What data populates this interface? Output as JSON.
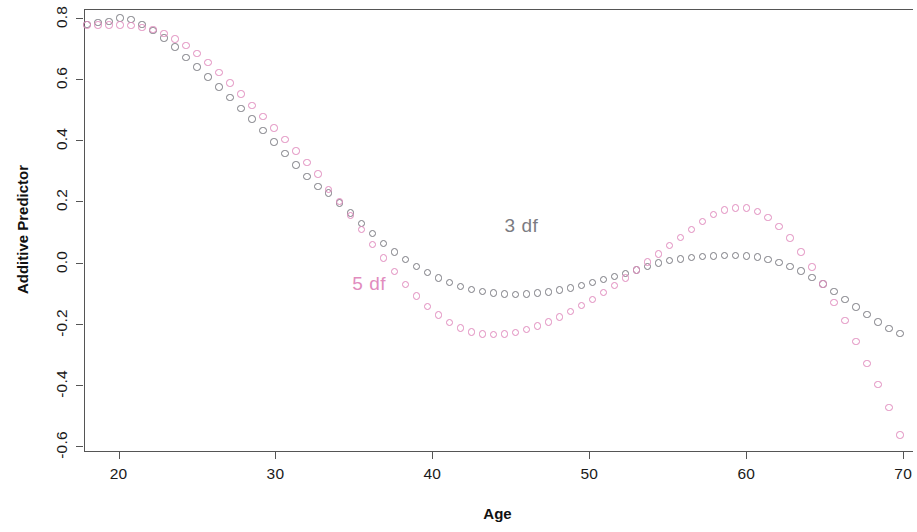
{
  "chart_data": {
    "type": "scatter",
    "title": "",
    "xlabel": "Age",
    "ylabel": "Additive Predictor",
    "xlim": [
      17.8,
      70.5
    ],
    "ylim": [
      -0.62,
      0.83
    ],
    "xticks": [
      20,
      30,
      40,
      50,
      60,
      70
    ],
    "yticks": [
      -0.6,
      -0.4,
      -0.2,
      0.0,
      0.2,
      0.4,
      0.6,
      0.8
    ],
    "xtick_labels": [
      "20",
      "30",
      "40",
      "50",
      "60",
      "70"
    ],
    "ytick_labels": [
      "-0.6",
      "-0.4",
      "-0.2",
      "0.0",
      "0.2",
      "0.4",
      "0.6",
      "0.8"
    ],
    "grid": false,
    "legend_position": "inline-annotations",
    "marker": "open-circle",
    "series": [
      {
        "name": "3 df",
        "color": "#7b7b82",
        "annotation": "3 df",
        "annotation_x": 44.6,
        "annotation_y": 0.115,
        "x": [
          18.0,
          18.7,
          19.4,
          20.1,
          20.8,
          21.5,
          22.2,
          22.9,
          23.6,
          24.3,
          25.0,
          25.7,
          26.4,
          27.1,
          27.8,
          28.5,
          29.2,
          29.9,
          30.6,
          31.3,
          32.0,
          32.7,
          33.4,
          34.1,
          34.8,
          35.5,
          36.2,
          36.9,
          37.6,
          38.3,
          39.0,
          39.7,
          40.4,
          41.1,
          41.8,
          42.5,
          43.2,
          43.9,
          44.6,
          45.3,
          46.0,
          46.7,
          47.4,
          48.1,
          48.8,
          49.5,
          50.2,
          50.9,
          51.6,
          52.3,
          53.0,
          53.7,
          54.4,
          55.1,
          55.8,
          56.5,
          57.2,
          57.9,
          58.6,
          59.3,
          60.0,
          60.7,
          61.4,
          62.1,
          62.8,
          63.5,
          64.2,
          64.9,
          65.6,
          66.3,
          67.0,
          67.7,
          68.4,
          69.1,
          69.8
        ],
        "y": [
          0.78,
          0.785,
          0.79,
          0.8,
          0.795,
          0.78,
          0.76,
          0.735,
          0.705,
          0.672,
          0.64,
          0.608,
          0.575,
          0.54,
          0.505,
          0.47,
          0.432,
          0.395,
          0.358,
          0.32,
          0.282,
          0.25,
          0.228,
          0.195,
          0.162,
          0.128,
          0.095,
          0.062,
          0.035,
          0.01,
          -0.012,
          -0.032,
          -0.05,
          -0.065,
          -0.078,
          -0.088,
          -0.095,
          -0.1,
          -0.103,
          -0.104,
          -0.103,
          -0.1,
          -0.096,
          -0.09,
          -0.083,
          -0.075,
          -0.066,
          -0.056,
          -0.046,
          -0.035,
          -0.024,
          -0.013,
          -0.002,
          0.006,
          0.012,
          0.017,
          0.02,
          0.022,
          0.023,
          0.023,
          0.022,
          0.018,
          0.01,
          0.0,
          -0.012,
          -0.028,
          -0.048,
          -0.07,
          -0.095,
          -0.12,
          -0.145,
          -0.17,
          -0.195,
          -0.215,
          -0.232
        ]
      },
      {
        "name": "5 df",
        "color": "#e18cbe",
        "annotation": "5 df",
        "annotation_x": 34.9,
        "annotation_y": -0.075,
        "x": [
          18.0,
          18.7,
          19.4,
          20.1,
          20.8,
          21.5,
          22.2,
          22.9,
          23.6,
          24.3,
          25.0,
          25.7,
          26.4,
          27.1,
          27.8,
          28.5,
          29.2,
          29.9,
          30.6,
          31.3,
          32.0,
          32.7,
          33.4,
          34.1,
          34.8,
          35.5,
          36.2,
          36.9,
          37.6,
          38.3,
          39.0,
          39.7,
          40.4,
          41.1,
          41.8,
          42.5,
          43.2,
          43.9,
          44.6,
          45.3,
          46.0,
          46.7,
          47.4,
          48.1,
          48.8,
          49.5,
          50.2,
          50.9,
          51.6,
          52.3,
          53.0,
          53.7,
          54.4,
          55.1,
          55.8,
          56.5,
          57.2,
          57.9,
          58.6,
          59.3,
          60.0,
          60.7,
          61.4,
          62.1,
          62.8,
          63.5,
          64.2,
          64.9,
          65.6,
          66.3,
          67.0,
          67.7,
          68.4,
          69.1,
          69.8
        ],
        "y": [
          0.778,
          0.778,
          0.778,
          0.778,
          0.775,
          0.77,
          0.762,
          0.75,
          0.732,
          0.71,
          0.685,
          0.655,
          0.622,
          0.588,
          0.552,
          0.515,
          0.478,
          0.44,
          0.402,
          0.365,
          0.328,
          0.29,
          0.24,
          0.2,
          0.155,
          0.108,
          0.06,
          0.015,
          -0.03,
          -0.072,
          -0.11,
          -0.143,
          -0.172,
          -0.196,
          -0.214,
          -0.227,
          -0.234,
          -0.236,
          -0.234,
          -0.228,
          -0.22,
          -0.208,
          -0.194,
          -0.178,
          -0.16,
          -0.14,
          -0.12,
          -0.098,
          -0.075,
          -0.05,
          -0.024,
          0.002,
          0.028,
          0.055,
          0.082,
          0.108,
          0.135,
          0.158,
          0.172,
          0.179,
          0.178,
          0.168,
          0.148,
          0.118,
          0.08,
          0.035,
          -0.015,
          -0.07,
          -0.13,
          -0.19,
          -0.258,
          -0.33,
          -0.4,
          -0.475,
          -0.565
        ]
      }
    ]
  }
}
